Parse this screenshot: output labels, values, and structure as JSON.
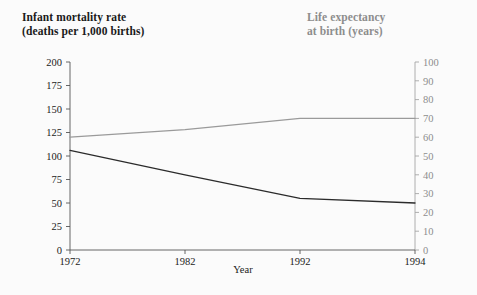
{
  "titles": {
    "left": "Infant mortality rate\n(deaths per 1,000 births)",
    "right": "Life expectancy\nat birth (years)"
  },
  "colors": {
    "infant_mortality_line": "#2b2b2b",
    "life_expectancy_line": "#9a9a9a",
    "left_axis_text": "#222222",
    "right_axis_text": "#8d8d8d",
    "background": "#fbfbfb"
  },
  "chart_data": {
    "type": "line",
    "title": "",
    "xlabel": "Year",
    "categories": [
      "1972",
      "1982",
      "1992",
      "1994"
    ],
    "grid": false,
    "legend": "none",
    "axes": {
      "left": {
        "label": "Infant mortality rate (deaths per 1,000 births)",
        "ylim": [
          0,
          200
        ],
        "ticks": [
          "0",
          "25",
          "50",
          "75",
          "100",
          "125",
          "150",
          "175",
          "200"
        ],
        "tick_values": [
          0,
          25,
          50,
          75,
          100,
          125,
          150,
          175,
          200
        ]
      },
      "right": {
        "label": "Life expectancy at birth (years)",
        "ylim": [
          0,
          100
        ],
        "ticks": [
          "0",
          "10",
          "20",
          "30",
          "40",
          "50",
          "60",
          "70",
          "80",
          "90",
          "100"
        ],
        "tick_values": [
          0,
          10,
          20,
          30,
          40,
          50,
          60,
          70,
          80,
          90,
          100
        ]
      }
    },
    "series": [
      {
        "name": "Infant mortality rate",
        "axis": "left",
        "color": "#2b2b2b",
        "values": [
          106,
          80,
          55,
          50
        ]
      },
      {
        "name": "Life expectancy at birth",
        "axis": "right",
        "color": "#9a9a9a",
        "values": [
          60,
          64,
          70,
          70
        ]
      }
    ]
  }
}
